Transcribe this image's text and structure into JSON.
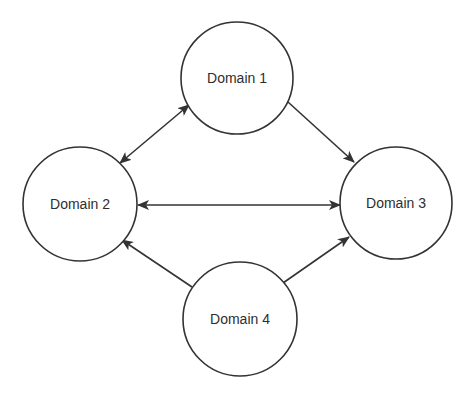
{
  "diagram": {
    "type": "directed-graph",
    "colors": {
      "stroke": "#333333",
      "text": "#2e2e2e",
      "background": "#ffffff"
    },
    "nodes": [
      {
        "id": "d1",
        "label": "Domain 1",
        "cx": 237,
        "cy": 78,
        "r": 56
      },
      {
        "id": "d2",
        "label": "Domain 2",
        "cx": 80,
        "cy": 204,
        "r": 57
      },
      {
        "id": "d3",
        "label": "Domain 3",
        "cx": 396,
        "cy": 203,
        "r": 56
      },
      {
        "id": "d4",
        "label": "Domain 4",
        "cx": 240,
        "cy": 319,
        "r": 57
      }
    ],
    "edges": [
      {
        "from": "Domain 1",
        "to": "Domain 2",
        "direction": "bidirectional",
        "x1": 189,
        "y1": 105,
        "x2": 120,
        "y2": 163
      },
      {
        "from": "Domain 1",
        "to": "Domain 3",
        "direction": "forward",
        "x1": 288,
        "y1": 102,
        "x2": 354,
        "y2": 162
      },
      {
        "from": "Domain 2",
        "to": "Domain 3",
        "direction": "bidirectional",
        "x1": 138,
        "y1": 205,
        "x2": 340,
        "y2": 205
      },
      {
        "from": "Domain 4",
        "to": "Domain 2",
        "direction": "forward",
        "x1": 192,
        "y1": 287,
        "x2": 122,
        "y2": 240
      },
      {
        "from": "Domain 4",
        "to": "Domain 3",
        "direction": "forward",
        "x1": 283,
        "y1": 283,
        "x2": 349,
        "y2": 237
      }
    ]
  }
}
